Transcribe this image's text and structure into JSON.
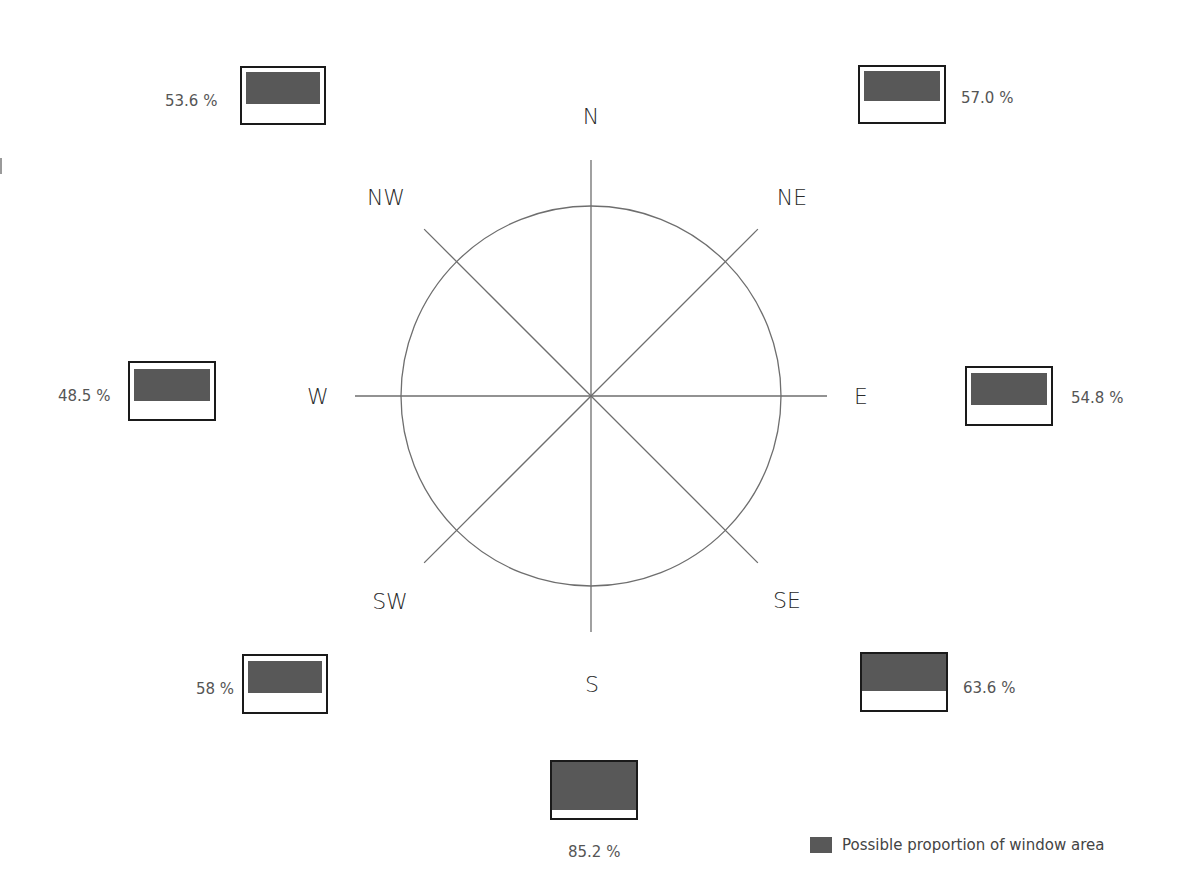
{
  "diagram": {
    "title": "",
    "center": {
      "x": 591,
      "y": 396
    },
    "circle_radius": 190,
    "spoke_length": 236,
    "line_color": "#6e6e6e",
    "directions": [
      {
        "key": "N",
        "label": "N",
        "x": 591,
        "y": 116
      },
      {
        "key": "NE",
        "label": "NE",
        "x": 792,
        "y": 197
      },
      {
        "key": "E",
        "label": "E",
        "x": 861,
        "y": 396
      },
      {
        "key": "SE",
        "label": "SE",
        "x": 787,
        "y": 600
      },
      {
        "key": "S",
        "label": "S",
        "x": 592,
        "y": 684
      },
      {
        "key": "SW",
        "label": "SW",
        "x": 390,
        "y": 601
      },
      {
        "key": "W",
        "label": "W",
        "x": 318,
        "y": 396
      },
      {
        "key": "NW",
        "label": "NW",
        "x": 386,
        "y": 197
      }
    ],
    "windows": [
      {
        "key": "NW",
        "value": "53.6 %",
        "box": {
          "x": 240,
          "y": 66,
          "w": 86,
          "h": 59
        },
        "fill": {
          "top": 4,
          "h": 32
        },
        "label_pos": {
          "x": 165,
          "y": 101
        }
      },
      {
        "key": "NE",
        "value": "57.0 %",
        "box": {
          "x": 858,
          "y": 65,
          "w": 88,
          "h": 59
        },
        "fill": {
          "top": 4,
          "h": 30
        },
        "label_pos": {
          "x": 961,
          "y": 98
        }
      },
      {
        "key": "W",
        "value": "48.5 %",
        "box": {
          "x": 128,
          "y": 361,
          "w": 88,
          "h": 60
        },
        "fill": {
          "top": 6,
          "h": 32
        },
        "label_pos": {
          "x": 58,
          "y": 396
        }
      },
      {
        "key": "E",
        "value": "54.8 %",
        "box": {
          "x": 965,
          "y": 366,
          "w": 88,
          "h": 60
        },
        "fill": {
          "top": 5,
          "h": 32
        },
        "label_pos": {
          "x": 1071,
          "y": 398
        }
      },
      {
        "key": "SW",
        "value": "58 %",
        "box": {
          "x": 242,
          "y": 654,
          "w": 86,
          "h": 60
        },
        "fill": {
          "top": 5,
          "h": 32
        },
        "label_pos": {
          "x": 196,
          "y": 689
        }
      },
      {
        "key": "SE",
        "value": "63.6 %",
        "box": {
          "x": 860,
          "y": 652,
          "w": 88,
          "h": 60
        },
        "fill": {
          "top": 0,
          "h": 37
        },
        "label_pos": {
          "x": 963,
          "y": 688
        }
      },
      {
        "key": "S",
        "value": "85.2 %",
        "box": {
          "x": 550,
          "y": 760,
          "w": 88,
          "h": 60
        },
        "fill": {
          "top": 0,
          "h": 48
        },
        "label_pos": {
          "x": 568,
          "y": 852
        }
      }
    ],
    "legend": {
      "swatch_color": "#585858",
      "label": "Possible proportion of window area"
    }
  }
}
